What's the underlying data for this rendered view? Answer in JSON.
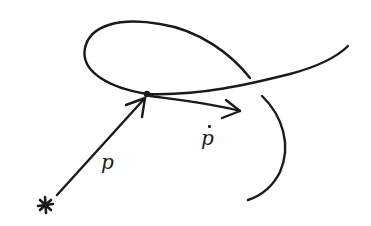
{
  "diagram": {
    "type": "hand-drawn vector diagram",
    "stroke_color": "#1a1a1a",
    "background": "#ffffff",
    "elements": {
      "origin": {
        "symbol": "*",
        "x": 45,
        "y": 205
      },
      "point": {
        "x": 147,
        "y": 94
      },
      "curve": {
        "description": "self-intersecting curve with a loop passing through the point"
      },
      "position_vector": {
        "label": "p",
        "from": [
          57,
          195
        ],
        "to": [
          145,
          98
        ]
      },
      "velocity_vector": {
        "label": "ṗ",
        "from": [
          150,
          96
        ],
        "to": [
          240,
          111
        ]
      }
    },
    "labels": {
      "position": "p",
      "velocity": "p",
      "origin_marker": "*"
    }
  }
}
